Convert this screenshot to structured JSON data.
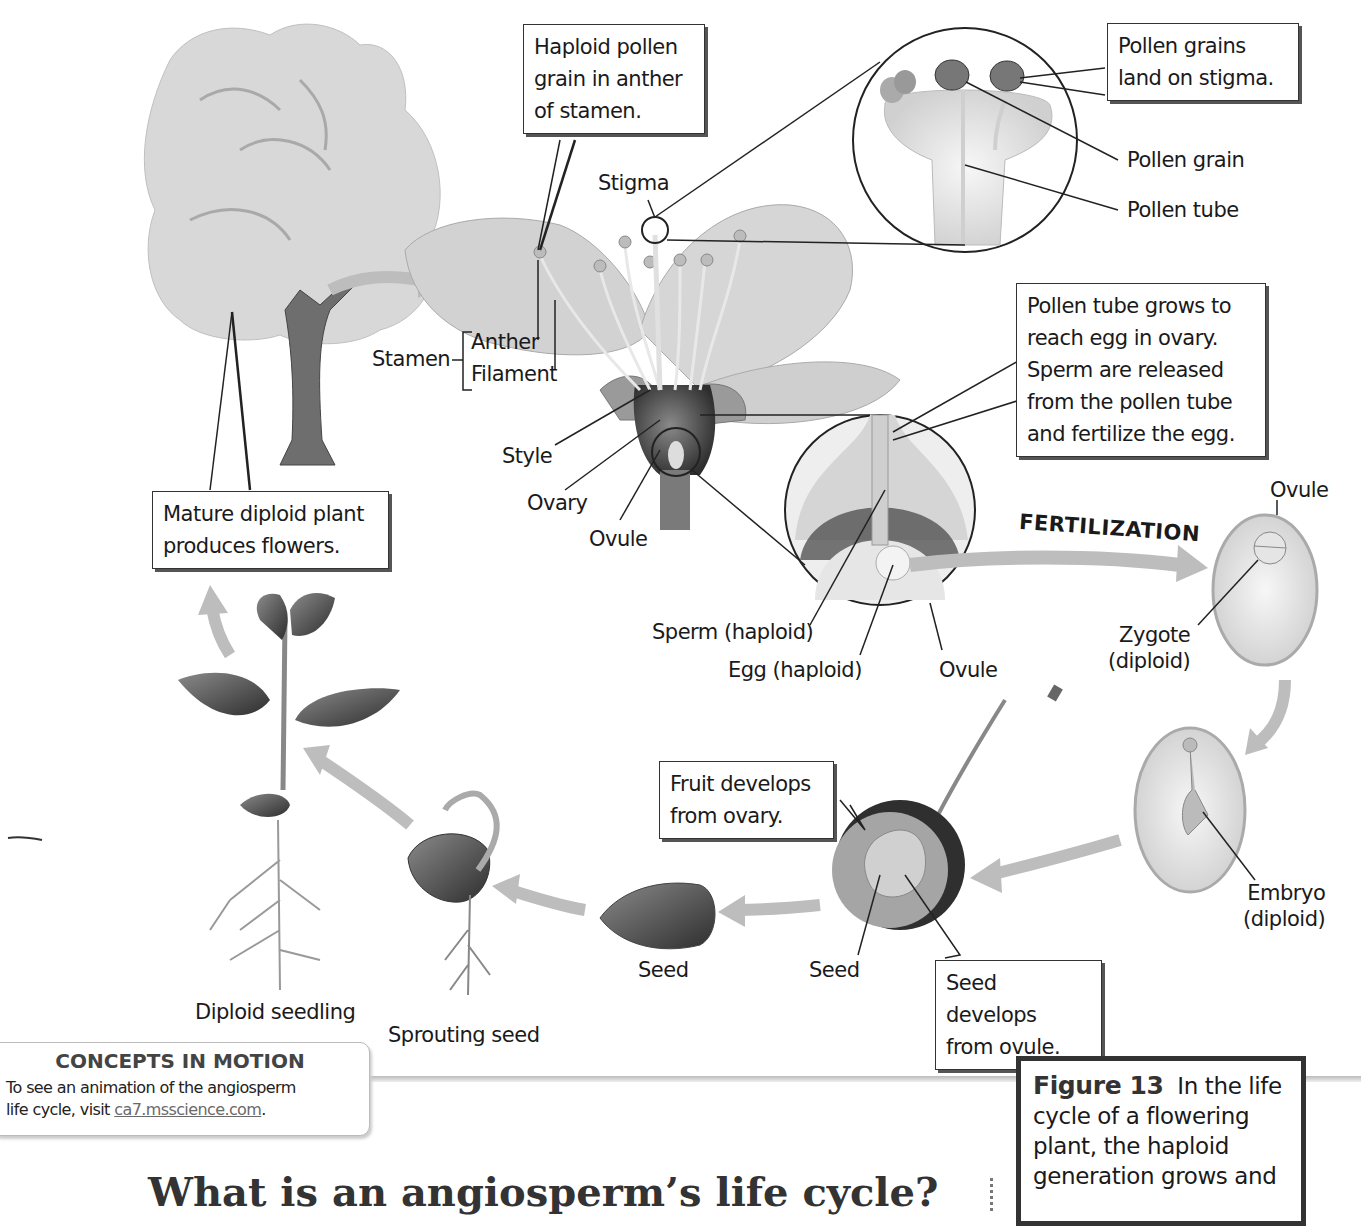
{
  "figure": {
    "number": "Figure 13",
    "caption_lines": [
      "In the life",
      "cycle of a flowering",
      "plant, the haploid",
      "generation grows and"
    ]
  },
  "callouts": {
    "haploid_pollen": "Haploid pollen\ngrain in anther\nof stamen.",
    "pollen_land": "Pollen grains\nland on stigma.",
    "pollen_tube_grows": "Pollen tube grows to\nreach egg in ovary.\nSperm are released\nfrom the pollen tube\nand fertilize the egg.",
    "mature_plant": "Mature diploid plant\nproduces flowers.",
    "fruit_develops": "Fruit develops\nfrom ovary.",
    "seed_develops": "Seed develops\nfrom ovule."
  },
  "labels": {
    "stigma": "Stigma",
    "pollen_grain": "Pollen grain",
    "pollen_tube": "Pollen tube",
    "stamen": "Stamen",
    "anther": "Anther",
    "filament": "Filament",
    "style": "Style",
    "ovary": "Ovary",
    "ovule_flower": "Ovule",
    "sperm": "Sperm (haploid)",
    "egg": "Egg (haploid)",
    "ovule_circle": "Ovule",
    "fertilization": "FERTILIZATION",
    "ovule_right": "Ovule",
    "zygote": "Zygote\n(diploid)",
    "embryo": "Embryo\n(diploid)",
    "seed_fruit": "Seed",
    "seed_loose": "Seed",
    "sprouting_seed": "Sprouting seed",
    "diploid_seedling": "Diploid seedling"
  },
  "concepts_in_motion": {
    "title": "CONCEPTS IN MOTION",
    "text_line1": "To see an animation of the angiosperm",
    "text_line2_prefix": "life cycle, visit ",
    "link": "ca7.msscience.com",
    "text_line2_suffix": "."
  },
  "section_heading": "What is an angiosperm’s life cycle?",
  "colors": {
    "arrow": "#bdbdbd",
    "text": "#1a1a1a",
    "box_border": "#333333",
    "link": "#6a6a6a"
  }
}
